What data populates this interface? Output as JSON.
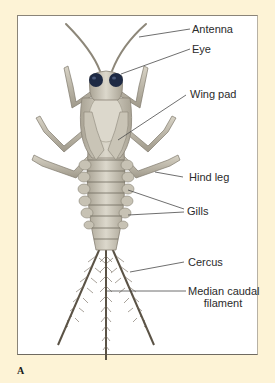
{
  "figure": {
    "panel_letter": "A",
    "labels": {
      "antenna": "Antenna",
      "eye": "Eye",
      "wing_pad": "Wing pad",
      "hind_leg": "Hind leg",
      "gills": "Gills",
      "cercus": "Cercus",
      "median_caudal_filament_line1": "Median caudal",
      "median_caudal_filament_line2": "filament"
    },
    "colors": {
      "background": "#fdf3d6",
      "frame_fill": "#ffffff",
      "body": "#cfcabd",
      "body_shadow": "#a9a394",
      "eye": "#1e2a44",
      "leader_line": "#4a4a4a",
      "tail": "#5a5245"
    }
  }
}
